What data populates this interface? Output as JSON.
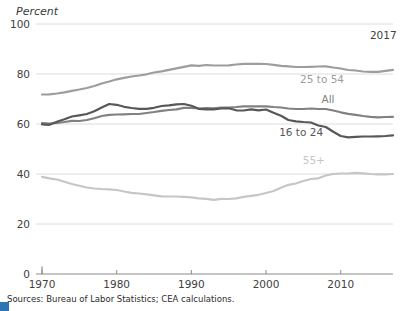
{
  "figure": {
    "axis_unit_label": "Percent",
    "sources_note": "Sources: Bureau of Labor Statistics; CEA calculations."
  },
  "colors": {
    "grid": "#dcdcdc",
    "axis": "#8c8c8c",
    "tick_text": "#404040",
    "endpoint_text": "#404040",
    "corner_mark": "#2e75b6"
  },
  "chart_data": {
    "type": "line",
    "title": "",
    "xlabel": "",
    "ylabel": "Percent",
    "xlim": [
      1970,
      2017
    ],
    "ylim": [
      0,
      100
    ],
    "yticks": [
      0,
      20,
      40,
      60,
      80,
      100
    ],
    "xticks": [
      1970,
      1980,
      1990,
      2000,
      2010
    ],
    "grid": "horizontal",
    "legend": "inline-labels",
    "x_years": [
      1970,
      1971,
      1972,
      1973,
      1974,
      1975,
      1976,
      1977,
      1978,
      1979,
      1980,
      1981,
      1982,
      1983,
      1984,
      1985,
      1986,
      1987,
      1988,
      1989,
      1990,
      1991,
      1992,
      1993,
      1994,
      1995,
      1996,
      1997,
      1998,
      1999,
      2000,
      2001,
      2002,
      2003,
      2004,
      2005,
      2006,
      2007,
      2008,
      2009,
      2010,
      2011,
      2012,
      2013,
      2014,
      2015,
      2016,
      2017
    ],
    "series": [
      {
        "name": "55+",
        "color": "#c6c6c6",
        "label_at": {
          "year": 2006.4,
          "value": 45.6
        },
        "values": [
          38.9,
          38.3,
          37.8,
          36.9,
          36.0,
          35.3,
          34.6,
          34.2,
          34.0,
          33.9,
          33.6,
          33.0,
          32.5,
          32.2,
          31.9,
          31.5,
          31.1,
          31.0,
          31.0,
          30.9,
          30.7,
          30.3,
          30.1,
          29.7,
          30.1,
          30.0,
          30.3,
          30.9,
          31.3,
          31.7,
          32.4,
          33.2,
          34.5,
          35.7,
          36.2,
          37.2,
          38.0,
          38.3,
          39.4,
          40.0,
          40.2,
          40.2,
          40.5,
          40.3,
          40.0,
          39.9,
          39.9,
          40.0
        ]
      },
      {
        "name": "25 to 54",
        "color": "#9d9d9d",
        "label_at": {
          "year": 2007.5,
          "value": 78.0
        },
        "values": [
          71.8,
          71.9,
          72.2,
          72.7,
          73.3,
          73.8,
          74.4,
          75.2,
          76.2,
          77.0,
          77.9,
          78.5,
          79.0,
          79.4,
          79.9,
          80.6,
          81.1,
          81.7,
          82.3,
          82.9,
          83.5,
          83.3,
          83.6,
          83.4,
          83.4,
          83.5,
          83.8,
          84.1,
          84.1,
          84.1,
          84.0,
          83.7,
          83.3,
          83.1,
          82.8,
          82.8,
          82.9,
          83.0,
          83.1,
          82.6,
          82.2,
          81.6,
          81.4,
          81.0,
          80.9,
          80.9,
          81.3,
          81.7
        ]
      },
      {
        "name": "All",
        "color": "#818181",
        "label_at": {
          "year": 2008.3,
          "value": 70.0
        },
        "values": [
          60.4,
          60.2,
          60.4,
          60.8,
          61.3,
          61.2,
          61.6,
          62.3,
          63.2,
          63.7,
          63.8,
          63.9,
          64.0,
          64.0,
          64.4,
          64.8,
          65.3,
          65.6,
          65.9,
          66.5,
          66.5,
          66.2,
          66.4,
          66.3,
          66.6,
          66.6,
          66.8,
          67.1,
          67.1,
          67.1,
          67.1,
          66.8,
          66.6,
          66.2,
          66.0,
          66.0,
          66.2,
          66.0,
          66.0,
          65.4,
          64.7,
          64.1,
          63.7,
          63.2,
          62.9,
          62.7,
          62.8,
          62.9
        ]
      },
      {
        "name": "16 to 24",
        "color": "#575757",
        "label_at": {
          "year": 2004.7,
          "value": 56.8
        },
        "values": [
          59.9,
          59.7,
          60.9,
          61.9,
          63.0,
          63.5,
          64.0,
          65.1,
          66.6,
          68.0,
          67.7,
          66.9,
          66.4,
          66.1,
          66.1,
          66.5,
          67.2,
          67.5,
          67.9,
          68.0,
          67.3,
          66.1,
          65.9,
          65.9,
          66.2,
          66.3,
          65.5,
          65.4,
          65.9,
          65.5,
          65.8,
          64.5,
          63.3,
          61.6,
          61.1,
          60.8,
          60.6,
          59.4,
          58.8,
          56.9,
          55.2,
          54.7,
          54.9,
          55.0,
          55.0,
          55.1,
          55.2,
          55.5
        ]
      }
    ],
    "annotations": [
      {
        "text": "2017",
        "year": 2015.7,
        "value": 95.8
      }
    ]
  }
}
